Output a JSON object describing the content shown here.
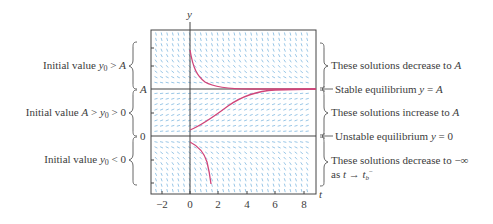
{
  "figure": {
    "axes": {
      "x_label": "t",
      "y_label": "y",
      "x_ticks": [
        "−2",
        "0",
        "2",
        "4",
        "6",
        "8"
      ],
      "x_tick_values": [
        -2,
        0,
        2,
        4,
        6,
        8
      ],
      "y_tick_labels": {
        "A": "A",
        "zero": "0"
      }
    },
    "left_annotations": [
      {
        "id": "above-A",
        "prefix": "Initial value ",
        "math": "y₀ > A"
      },
      {
        "id": "between",
        "prefix": "Initial value ",
        "math": "A > y₀ > 0"
      },
      {
        "id": "below-0",
        "prefix": "Initial value ",
        "math": "y₀ < 0"
      }
    ],
    "right_annotations": [
      {
        "id": "decrease-to-A",
        "text": "These solutions decrease to A"
      },
      {
        "id": "stable",
        "text": "Stable equilibrium y = A"
      },
      {
        "id": "increase-to-A",
        "text": "These solutions increase to A"
      },
      {
        "id": "unstable",
        "text": "Unstable equilibrium y = 0"
      },
      {
        "id": "decrease-to-neg-inf",
        "line1": "These solutions decrease to −∞",
        "line2": "as t → t_b⁻"
      }
    ],
    "colors": {
      "frame": "#444444",
      "slope_marks": "#7fb8df",
      "solution_curves": "#d0457a",
      "text": "#3c3c3c"
    }
  },
  "chart_data": {
    "type": "line",
    "title": "",
    "xlabel": "t",
    "ylabel": "y",
    "xlim": [
      -2.8,
      8.9
    ],
    "ylim": [
      "below 0",
      "above A"
    ],
    "grid": false,
    "equilibria": [
      {
        "y": "A",
        "label": "Stable equilibrium y = A"
      },
      {
        "y": 0,
        "label": "Unstable equilibrium y = 0"
      }
    ],
    "series": [
      {
        "name": "y0 > A",
        "behavior": "decreases to A",
        "t": [
          0,
          0.5,
          1,
          2,
          3,
          4,
          6,
          8
        ],
        "y_rel_A": [
          1.8,
          1.35,
          1.18,
          1.06,
          1.02,
          1.0,
          1.0,
          1.0
        ]
      },
      {
        "name": "A > y0 > 0",
        "behavior": "increases to A",
        "t": [
          0,
          1,
          2,
          3,
          4,
          5,
          6,
          8
        ],
        "y_rel_A": [
          0.08,
          0.25,
          0.5,
          0.75,
          0.9,
          0.96,
          0.99,
          1.0
        ]
      },
      {
        "name": "y0 < 0",
        "behavior": "decreases to -infinity as t -> t_b-",
        "t": [
          0,
          0.5,
          1.0,
          1.4,
          1.6
        ],
        "y_rel_A": [
          -0.12,
          -0.3,
          -0.65,
          -1.2,
          -1.45
        ]
      }
    ]
  }
}
